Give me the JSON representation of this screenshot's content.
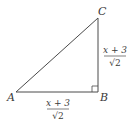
{
  "diagram": {
    "type": "right-triangle",
    "vertices": {
      "A": {
        "label": "A",
        "x": 16,
        "y": 92
      },
      "B": {
        "label": "B",
        "x": 98,
        "y": 92
      },
      "C": {
        "label": "C",
        "x": 98,
        "y": 18
      }
    },
    "right_angle_at": "B",
    "side_labels": {
      "AB": {
        "numerator": "x + 3",
        "denominator": "√2"
      },
      "BC": {
        "numerator": "x + 3",
        "denominator": "√2"
      }
    },
    "line_color": "#4a4a4a"
  }
}
